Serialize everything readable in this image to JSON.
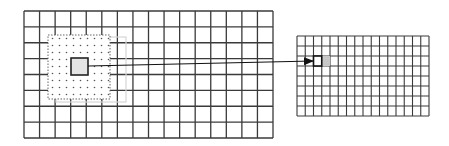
{
  "diagram": {
    "type": "convolution-receptive-field-mapping",
    "colors": {
      "grid_line": "#3a3a3a",
      "background": "#ffffff",
      "dot": "#555555",
      "ghost_window": "#d6d6d6",
      "center_fill": "#e4e4e4",
      "target_fill": "#c8c8c8",
      "arrow": "#111111"
    },
    "input_grid": {
      "x": 24,
      "y": 11,
      "width": 249,
      "height": 127,
      "cols": 16,
      "rows": 8,
      "receptive_field": {
        "x": 48,
        "y": 35,
        "width": 62,
        "height": 64
      },
      "ghost_window": {
        "x": 56,
        "y": 37,
        "width": 70,
        "height": 65
      },
      "center_cell": {
        "x": 71,
        "y": 58,
        "width": 17,
        "height": 17
      }
    },
    "output_grid": {
      "x": 297,
      "y": 36,
      "width": 132,
      "height": 80,
      "cols": 16,
      "rows": 8,
      "active_cell": {
        "col": 2,
        "row": 2
      },
      "next_cell": {
        "col": 3,
        "row": 2
      }
    },
    "arrow": {
      "x1": 88,
      "y1": 66,
      "x2": 313,
      "y2": 61
    }
  }
}
